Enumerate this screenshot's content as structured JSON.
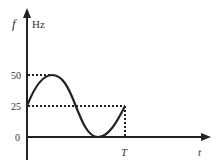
{
  "diagram": {
    "y_axis": {
      "symbol": "f",
      "unit": "Hz"
    },
    "x_axis": {
      "symbol": "t",
      "mark": "T"
    },
    "y_ticks": [
      {
        "label": "50",
        "value": 50
      },
      {
        "label": "25",
        "value": 25
      },
      {
        "label": "0",
        "value": 0
      }
    ],
    "curve": {
      "description": "Sinusoidal frequency vs time: starts at 25, rises to 50, falls to 0, returns to 25 at T",
      "start_value": 25,
      "max_value": 50,
      "min_value": 0,
      "end_value": 25,
      "end_time_label": "T"
    },
    "colors": {
      "line": "#222222",
      "text": "#333333",
      "background": "#ffffff"
    }
  }
}
